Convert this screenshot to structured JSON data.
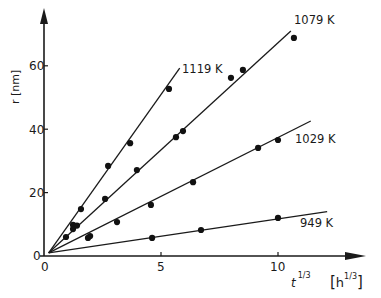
{
  "chart_data": {
    "type": "scatter",
    "title": "",
    "xlabel": "t^1/3",
    "xlabel_unit": "[h^1/3]",
    "ylabel": "r [nm]",
    "xlim": [
      0,
      13.5
    ],
    "ylim": [
      0,
      75
    ],
    "x_ticks": [
      0,
      5,
      10
    ],
    "y_ticks": [
      0,
      20,
      40,
      60
    ],
    "x_tick_labels": [
      "0",
      "5",
      "10"
    ],
    "y_tick_labels": [
      "0",
      "20",
      "40",
      "60"
    ],
    "grid": false,
    "legend": "inline labels at line ends",
    "series": [
      {
        "name": "1119 K",
        "points": [
          [
            0.94,
            6.0
          ],
          [
            1.58,
            14.8
          ],
          [
            2.74,
            28.4
          ],
          [
            3.68,
            35.6
          ],
          [
            5.34,
            52.7
          ]
        ],
        "fit_line": [
          [
            0.2,
            1.0
          ],
          [
            5.8,
            59.3
          ]
        ]
      },
      {
        "name": "1079 K",
        "points": [
          [
            1.24,
            8.5
          ],
          [
            1.24,
            9.8
          ],
          [
            1.41,
            9.6
          ],
          [
            2.61,
            18.0
          ],
          [
            3.97,
            27.1
          ],
          [
            5.64,
            37.5
          ],
          [
            5.94,
            39.4
          ],
          [
            7.99,
            56.2
          ],
          [
            8.5,
            58.7
          ],
          [
            10.68,
            68.8
          ]
        ],
        "fit_line": [
          [
            0.2,
            1.0
          ],
          [
            10.55,
            71.0
          ]
        ]
      },
      {
        "name": "1029 K",
        "points": [
          [
            1.88,
            5.7
          ],
          [
            1.97,
            6.3
          ],
          [
            3.12,
            10.7
          ],
          [
            4.57,
            16.1
          ],
          [
            6.37,
            23.3
          ],
          [
            9.15,
            34.1
          ],
          [
            10.0,
            36.6
          ]
        ],
        "fit_line": [
          [
            0.2,
            1.0
          ],
          [
            11.4,
            42.6
          ]
        ]
      },
      {
        "name": "949 K",
        "points": [
          [
            4.62,
            5.7
          ],
          [
            6.71,
            8.2
          ],
          [
            10.0,
            12.0
          ]
        ],
        "fit_line": [
          [
            0.2,
            1.0
          ],
          [
            12.1,
            14.0
          ]
        ]
      }
    ]
  },
  "labels": {
    "y_axis_title": "r [nm]",
    "x_axis_title_base": "t",
    "x_axis_title_exp": "1/3",
    "x_axis_unit_base": "h",
    "x_axis_unit_exp": "1/3",
    "origin_y": "0",
    "origin_x": "0",
    "series": [
      "1119 K",
      "1079 K",
      "1029 K",
      "949 K"
    ]
  }
}
